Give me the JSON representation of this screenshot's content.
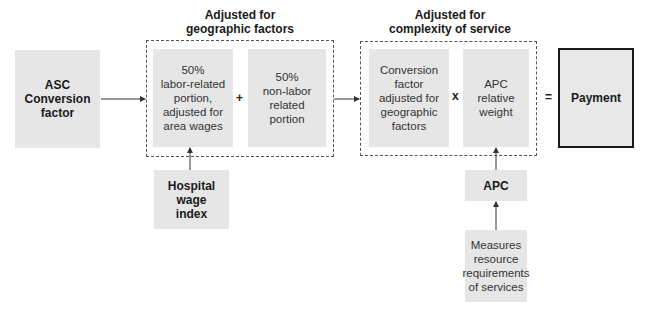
{
  "headings": {
    "geographic": "Adjusted for geographic factors",
    "geographic_line1": "Adjusted for",
    "geographic_line2": "geographic factors",
    "complexity_line1": "Adjusted for",
    "complexity_line2": "complexity of service"
  },
  "nodes": {
    "asc": [
      "ASC",
      "Conversion",
      "factor"
    ],
    "labor": [
      "50%",
      "labor-related",
      "portion,",
      "adjusted for",
      "area wages"
    ],
    "nonlabor": [
      "50%",
      "non-labor",
      "related",
      "portion"
    ],
    "conversion_adjusted": [
      "Conversion",
      "factor",
      "adjusted for",
      "geographic",
      "factors"
    ],
    "apc_weight": [
      "APC",
      "relative",
      "weight"
    ],
    "payment": [
      "Payment"
    ],
    "hospital_wage": [
      "Hospital",
      "wage",
      "index"
    ],
    "apc": [
      "APC"
    ],
    "measures": [
      "Measures",
      "resource",
      "requirements",
      "of services"
    ]
  },
  "operators": {
    "plus": "+",
    "times": "x",
    "equals": "="
  }
}
